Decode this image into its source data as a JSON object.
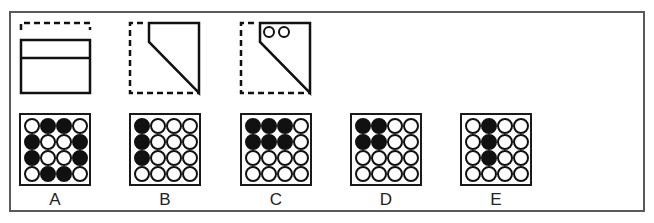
{
  "puzzle": {
    "question_figures": [
      {
        "id": "fig-1",
        "description": "sheet folded down from top: dashed top edge outline, solid rectangle with horizontal fold line"
      },
      {
        "id": "fig-2",
        "description": "dashed square with top-left corner folded diagonally to bottom-right"
      },
      {
        "id": "fig-3",
        "description": "folded shape with two punched holes near top-left",
        "holes": 2
      }
    ],
    "options": [
      {
        "label": "A",
        "grid": [
          [
            0,
            1,
            1,
            0
          ],
          [
            1,
            0,
            0,
            1
          ],
          [
            1,
            0,
            0,
            1
          ],
          [
            0,
            1,
            1,
            0
          ]
        ]
      },
      {
        "label": "B",
        "grid": [
          [
            1,
            0,
            0,
            0
          ],
          [
            1,
            0,
            0,
            0
          ],
          [
            1,
            0,
            0,
            0
          ],
          [
            0,
            0,
            0,
            0
          ]
        ]
      },
      {
        "label": "C",
        "grid": [
          [
            1,
            1,
            1,
            0
          ],
          [
            1,
            1,
            1,
            0
          ],
          [
            0,
            0,
            0,
            0
          ],
          [
            0,
            0,
            0,
            0
          ]
        ]
      },
      {
        "label": "D",
        "grid": [
          [
            1,
            1,
            0,
            0
          ],
          [
            1,
            1,
            0,
            0
          ],
          [
            0,
            0,
            0,
            0
          ],
          [
            0,
            0,
            0,
            0
          ]
        ]
      },
      {
        "label": "E",
        "grid": [
          [
            0,
            1,
            0,
            0
          ],
          [
            0,
            1,
            0,
            0
          ],
          [
            0,
            1,
            0,
            0
          ],
          [
            0,
            0,
            0,
            0
          ]
        ]
      }
    ]
  },
  "colors": {
    "ink": "#111111",
    "frame": "#5a5a5a",
    "background": "#ffffff"
  }
}
